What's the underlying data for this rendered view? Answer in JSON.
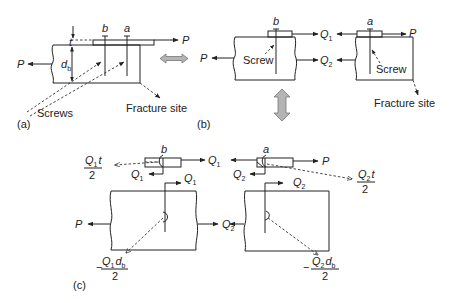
{
  "figure": {
    "panels": {
      "a": {
        "tag": "(a)",
        "labels": {
          "t": "t",
          "b": "b",
          "a": "a",
          "P_right": "P",
          "P_left": "P",
          "d_b": "d",
          "d_b_sub": "b",
          "screws": "Screws",
          "fracture": "Fracture site"
        }
      },
      "b": {
        "tag": "(b)",
        "labels": {
          "b": "b",
          "a": "a",
          "P_left": "P",
          "P_right": "P",
          "Q1": "Q",
          "Q1_sub": "1",
          "Q2": "Q",
          "Q2_sub": "2",
          "screw_left": "Screw",
          "screw_right": "Screw",
          "fracture": "Fracture site"
        }
      },
      "c": {
        "tag": "(c)",
        "labels": {
          "b": "b",
          "a": "a",
          "P_left": "P",
          "P_right": "P",
          "Q": "Q",
          "sub1": "1",
          "sub2": "2",
          "t": "t",
          "d": "d",
          "d_sub": "b",
          "two": "2",
          "minus": "−"
        }
      }
    },
    "arrows": {
      "horizontal": "double-arrow-horizontal",
      "vertical": "double-arrow-vertical"
    },
    "colors": {
      "line": "#222222",
      "arrow_fill": "#b4b4b4",
      "background": "#ffffff"
    }
  }
}
